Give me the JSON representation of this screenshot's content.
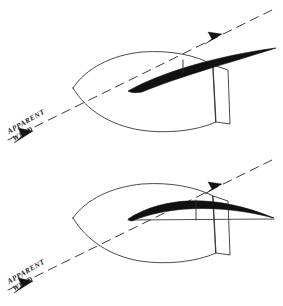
{
  "figure": {
    "background_color": "#ffffff",
    "ink_color": "#1d1d1d",
    "sail_color": "#111111",
    "width": 283,
    "height": 306
  },
  "panels": [
    {
      "id": "upper-panel",
      "name": "sail-eased-panel",
      "description": "Boat plan view with sail eased out to port, apparent wind from lower left",
      "hull": {
        "name": "boat-hull-upper",
        "bow_point": [
          73,
          88
        ],
        "outline_path": "M 73 88 C 86 68 112 55 142 52 C 170 50 196 55 213 65 L 216 122 C 196 131 166 134 140 130 C 110 125 86 110 73 88 Z",
        "transom_path": "M 213 65 L 228 70 L 230 124 L 216 122 Z"
      },
      "sail": {
        "name": "sail-upper",
        "tack_point": [
          128,
          91
        ],
        "clew_point": [
          276,
          48
        ],
        "shape_path": "M 128 91 C 160 73 215 56 276 48 C 232 62 178 77 142 92 C 136 93 131 93 128 91 Z",
        "camber_tick": {
          "x": 183,
          "y1": 60,
          "y2": 73
        }
      },
      "wind": {
        "name": "apparent-wind-upper",
        "line_start": [
          8,
          140
        ],
        "line_end": [
          272,
          10
        ],
        "arrowhead_tip_forward": [
          221,
          35
        ],
        "arrowhead_tip_back": [
          15,
          137
        ],
        "label_line1": "APPARENT",
        "label_line2": "WIND",
        "label_anchor": [
          10,
          132
        ],
        "label_rotation_deg": -30
      }
    },
    {
      "id": "lower-panel",
      "name": "sail-trimmed-panel",
      "description": "Boat plan view with sail trimmed in close to centerline, boom and camber shown",
      "hull": {
        "name": "boat-hull-lower",
        "bow_point": [
          73,
          218
        ],
        "outline_path": "M 73 218 C 86 199 112 187 142 184 C 170 182 196 187 213 196 L 216 253 C 196 262 166 265 140 261 C 110 256 86 240 73 218 Z",
        "transom_path": "M 213 196 L 228 201 L 230 255 L 216 253 Z"
      },
      "sail": {
        "name": "sail-lower",
        "tack_point": [
          128,
          219
        ],
        "clew_point": [
          274,
          218
        ],
        "shape_path": "M 128 219 C 162 197 214 193 274 218 C 216 203 165 207 132 221 C 130 221 129 220 128 219 Z",
        "boom_path": "M 128 219 L 274 218",
        "chord_line": {
          "x1": 128,
          "y1": 219,
          "x2": 274,
          "y2": 218
        },
        "camber_tick": {
          "x": 196,
          "y1": 200,
          "y2": 219
        }
      },
      "wind": {
        "name": "apparent-wind-lower",
        "line_start": [
          8,
          290
        ],
        "line_end": [
          272,
          160
        ],
        "arrowhead_tip_forward": [
          221,
          185
        ],
        "arrowhead_tip_back": [
          15,
          287
        ],
        "label_line1": "APPARENT",
        "label_line2": "WIND",
        "label_anchor": [
          10,
          282
        ],
        "label_rotation_deg": -30
      }
    }
  ],
  "labels": {
    "apparent_wind_upper_line1": "APPARENT",
    "apparent_wind_upper_line2": "WIND",
    "apparent_wind_lower_line1": "APPARENT",
    "apparent_wind_lower_line2": "WIND"
  }
}
